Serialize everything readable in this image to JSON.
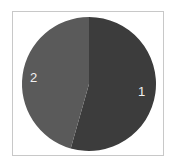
{
  "chart_data": {
    "type": "pie",
    "title": "",
    "categories": [
      "1",
      "2"
    ],
    "values": [
      54.4,
      45.6
    ],
    "colors": [
      "#3c3c3c",
      "#5a5a5a"
    ],
    "start_angle_deg": 0,
    "direction": "clockwise",
    "legend": "none",
    "labels_inside": true
  },
  "labels": {
    "slice1": "1",
    "slice2": "2"
  }
}
